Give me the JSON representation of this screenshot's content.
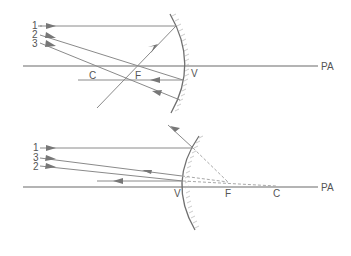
{
  "figure": {
    "type": "ray-diagram",
    "panels": [
      {
        "name": "concave-mirror",
        "ray_labels": [
          "1",
          "2",
          "3"
        ],
        "point_labels": {
          "center": "C",
          "focus": "F",
          "vertex": "V"
        },
        "axis_label": "PA"
      },
      {
        "name": "convex-mirror",
        "ray_labels": [
          "1",
          "3",
          "2"
        ],
        "point_labels": {
          "vertex": "V",
          "focus": "F",
          "center": "C"
        },
        "axis_label": "PA"
      }
    ]
  },
  "colors": {
    "line": "#8a8a8a",
    "axis": "#6a6a6a",
    "label": "#555555",
    "background": "#ffffff"
  }
}
